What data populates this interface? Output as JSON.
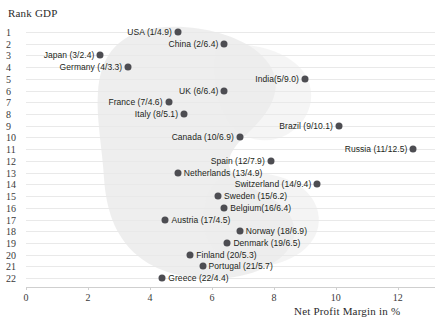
{
  "chart_data": {
    "type": "scatter",
    "title": "",
    "xlabel": "Net Profit Margin in %",
    "ylabel": "Rank GDP",
    "xlim": [
      0,
      13.2
    ],
    "ylim": [
      0.5,
      22.5
    ],
    "grid": true,
    "legend": null,
    "xticks": [
      0,
      2,
      4,
      6,
      8,
      10,
      12
    ],
    "yticks": [
      1,
      2,
      3,
      4,
      5,
      6,
      7,
      8,
      9,
      10,
      11,
      12,
      13,
      14,
      15,
      16,
      17,
      18,
      19,
      20,
      21,
      22
    ],
    "annotation_shape": "light-gray-cluster-blob",
    "points": [
      {
        "label": "USA (1/4.9)",
        "country": "USA",
        "rank": 1,
        "margin": 4.9,
        "side": "left"
      },
      {
        "label": "China (2/6.4)",
        "country": "China",
        "rank": 2,
        "margin": 6.4,
        "side": "left"
      },
      {
        "label": "Japan (3/2.4)",
        "country": "Japan",
        "rank": 3,
        "margin": 2.4,
        "side": "left"
      },
      {
        "label": "Germany (4/3.3)",
        "country": "Germany",
        "rank": 4,
        "margin": 3.3,
        "side": "left"
      },
      {
        "label": "India(5/9.0)",
        "country": "India",
        "rank": 5,
        "margin": 9.0,
        "side": "left"
      },
      {
        "label": "UK (6/6.4)",
        "country": "UK",
        "rank": 6,
        "margin": 6.4,
        "side": "left"
      },
      {
        "label": "France (7/4.6)",
        "country": "France",
        "rank": 7,
        "margin": 4.6,
        "side": "left"
      },
      {
        "label": "Italy (8/5.1)",
        "country": "Italy",
        "rank": 8,
        "margin": 5.1,
        "side": "left"
      },
      {
        "label": "Brazil (9/10.1)",
        "country": "Brazil",
        "rank": 9,
        "margin": 10.1,
        "side": "left"
      },
      {
        "label": "Canada (10/6.9)",
        "country": "Canada",
        "rank": 10,
        "margin": 6.9,
        "side": "left"
      },
      {
        "label": "Russia (11/12.5)",
        "country": "Russia",
        "rank": 11,
        "margin": 12.5,
        "side": "left"
      },
      {
        "label": "Spain (12/7.9)",
        "country": "Spain",
        "rank": 12,
        "margin": 7.9,
        "side": "left"
      },
      {
        "label": "Netherlands (13/4.9)",
        "country": "Netherlands",
        "rank": 13,
        "margin": 4.9,
        "side": "right"
      },
      {
        "label": "Switzerland (14/9.4)",
        "country": "Switzerland",
        "rank": 14,
        "margin": 9.4,
        "side": "left"
      },
      {
        "label": "Sweden (15/6.2)",
        "country": "Sweden",
        "rank": 15,
        "margin": 6.2,
        "side": "right"
      },
      {
        "label": "Belgium(16/6.4)",
        "country": "Belgium",
        "rank": 16,
        "margin": 6.4,
        "side": "right"
      },
      {
        "label": "Austria (17/4.5)",
        "country": "Austria",
        "rank": 17,
        "margin": 4.5,
        "side": "right"
      },
      {
        "label": "Norway (18/6.9)",
        "country": "Norway",
        "rank": 18,
        "margin": 6.9,
        "side": "right"
      },
      {
        "label": "Denmark (19/6.5)",
        "country": "Denmark",
        "rank": 19,
        "margin": 6.5,
        "side": "right"
      },
      {
        "label": "Finland (20/5.3)",
        "country": "Finland",
        "rank": 20,
        "margin": 5.3,
        "side": "right"
      },
      {
        "label": "Portugal (21/5.7)",
        "country": "Portugal",
        "rank": 21,
        "margin": 5.7,
        "side": "right"
      },
      {
        "label": "Greece (22/4.4)",
        "country": "Greece",
        "rank": 22,
        "margin": 4.4,
        "side": "right"
      }
    ]
  },
  "axes": {
    "y_title": "Rank GDP",
    "x_title": "Net Profit Margin in %"
  },
  "colors": {
    "marker": "#4d4d52",
    "gridline": "#e9e9e9",
    "axis_line": "#cfcfcf",
    "blob": "#ededed",
    "text": "#231f20"
  }
}
